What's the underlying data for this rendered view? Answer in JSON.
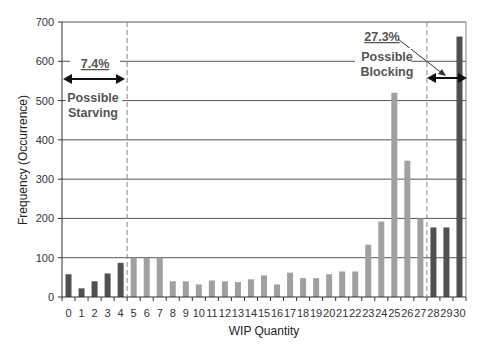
{
  "chart_data": {
    "type": "bar",
    "title": "",
    "xlabel": "WIP Quantity",
    "ylabel": "Frequency (Occurrence)",
    "ylim": [
      0,
      700
    ],
    "yticks": [
      0,
      100,
      200,
      300,
      400,
      500,
      600,
      700
    ],
    "grid": true,
    "categories": [
      "0",
      "1",
      "2",
      "3",
      "4",
      "5",
      "6",
      "7",
      "8",
      "9",
      "10",
      "11",
      "12",
      "13",
      "14",
      "15",
      "16",
      "17",
      "18",
      "19",
      "20",
      "21",
      "22",
      "23",
      "24",
      "25",
      "26",
      "27",
      "28",
      "29",
      "30"
    ],
    "values": [
      58,
      22,
      40,
      60,
      87,
      100,
      100,
      100,
      40,
      40,
      32,
      42,
      40,
      38,
      45,
      55,
      32,
      62,
      48,
      48,
      58,
      65,
      65,
      133,
      192,
      520,
      347,
      200,
      177,
      177,
      663
    ],
    "bar_colors": {
      "starving_region": "#505050",
      "normal_region": "#a0a0a0",
      "blocking_region": "#505050"
    },
    "regions": [
      {
        "name": "starving",
        "from": 0,
        "to": 4,
        "label": "Possible Starving",
        "percent": "7.4%"
      },
      {
        "name": "blocking",
        "from": 28,
        "to": 30,
        "label": "Possible Blocking",
        "percent": "27.3%"
      }
    ],
    "dividers_after": [
      4,
      27
    ],
    "annotations": [
      {
        "text": "7.4%",
        "underlined": true
      },
      {
        "text": "Possible Starving"
      },
      {
        "text": "27.3%",
        "underlined": true
      },
      {
        "text": "Possible Blocking"
      }
    ]
  },
  "labels": {
    "xlabel": "WIP Quantity",
    "ylabel": "Frequency (Occurrence)",
    "starving_pct": "7.4%",
    "starving_line1": "Possible",
    "starving_line2": "Starving",
    "blocking_pct": "27.3%",
    "blocking_line1": "Possible",
    "blocking_line2": "Blocking"
  }
}
